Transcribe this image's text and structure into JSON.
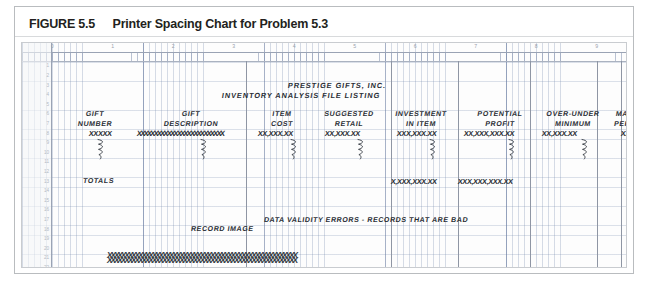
{
  "figure": {
    "label": "FIGURE 5.5",
    "title": "Printer Spacing Chart for Problem 5.3"
  },
  "chart_data": {
    "type": "table",
    "title": "Printer Spacing Chart for Problem 5.3",
    "grid": {
      "ruler_ticks": [
        "0",
        "1",
        "2",
        "3",
        "4",
        "5",
        "6",
        "7",
        "8",
        "9",
        "10"
      ],
      "row_numbers": [
        "1",
        "2",
        "3",
        "4",
        "5",
        "6",
        "7",
        "8",
        "9",
        "10",
        "11",
        "12",
        "13",
        "14",
        "15",
        "16",
        "17",
        "18",
        "19",
        "20",
        "21",
        "22"
      ],
      "print_positions_per_tick": 10,
      "grid_on": true
    },
    "report_headings": [
      {
        "text": "PRESTIGE GIFTS, INC.",
        "line": 3
      },
      {
        "text": "INVENTORY ANALYSIS FILE LISTING",
        "line": 4
      }
    ],
    "columns": [
      {
        "heading_line1": "GIFT",
        "heading_line2": "NUMBER",
        "detail": "XXXXX",
        "total": ""
      },
      {
        "heading_line1": "GIFT",
        "heading_line2": "DESCRIPTION",
        "detail": "XXXXXXXXXXXXXXXXXXXXXXXXXX",
        "total": ""
      },
      {
        "heading_line1": "ITEM",
        "heading_line2": "COST",
        "detail": "XX,XXX.XX",
        "total": ""
      },
      {
        "heading_line1": "SUGGESTED",
        "heading_line2": "RETAIL",
        "detail": "XX,XXX.XX",
        "total": ""
      },
      {
        "heading_line1": "INVESTMENT",
        "heading_line2": "IN ITEM",
        "detail": "XXX,XXX.XX",
        "total": "X,XXX,XXX.XX"
      },
      {
        "heading_line1": "POTENTIAL",
        "heading_line2": "PROFIT",
        "detail": "XX,XXX,XXX.XX",
        "total": "XXX,XXX,XXX.XX"
      },
      {
        "heading_line1": "OVER-UNDER",
        "heading_line2": "MINIMUM",
        "detail": "XX,XXX.XX",
        "total": ""
      },
      {
        "heading_line1": "MARKUP",
        "heading_line2": "PERCENT",
        "detail": "XXX%",
        "total": ""
      }
    ],
    "totals_label": "TOTALS",
    "annotations": [
      {
        "text": "DATA VALIDITY ERRORS - RECORDS THAT ARE BAD",
        "line": 16
      },
      {
        "text": "RECORD IMAGE",
        "line": 17
      }
    ],
    "error_record_image": "XXXXXXXXXXXXXXXXXXXXXXXXXXXXXXXXXXXXXXXXXXXXXXXXXXXXXXX"
  },
  "colors": {
    "grid": "#7b8caf",
    "ink": "#2b2f36",
    "frame": "#b9bcbf",
    "caption": "#231f20"
  }
}
